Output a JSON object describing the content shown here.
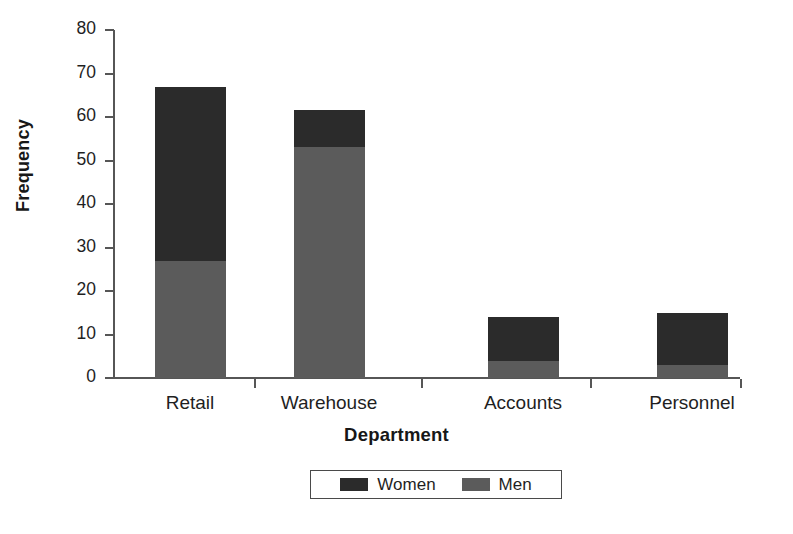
{
  "chart_data": {
    "type": "bar",
    "subtype": "stacked-bar",
    "title": "",
    "xlabel": "Department",
    "ylabel": "Frequency",
    "categories": [
      "Retail",
      "Warehouse",
      "Accounts",
      "Personnel"
    ],
    "series": [
      {
        "name": "Women",
        "values": [
          40,
          8.5,
          10,
          12
        ],
        "color": "#2b2b2b"
      },
      {
        "name": "Men",
        "values": [
          27,
          53,
          4,
          3
        ],
        "color": "#5b5b5b"
      }
    ],
    "stack_totals": [
      67,
      61.5,
      14,
      15
    ],
    "stack_order": [
      "Men",
      "Women"
    ],
    "ylim": [
      0,
      80
    ],
    "yticks": [
      0,
      10,
      20,
      30,
      40,
      50,
      60,
      70,
      80
    ],
    "ytick_labels": [
      "0",
      "10",
      "20",
      "30",
      "40",
      "50",
      "60",
      "70",
      "80"
    ],
    "grid": false,
    "legend_position": "bottom",
    "legend_entries": [
      "Women",
      "Men"
    ]
  },
  "axis": {
    "y_title": "Frequency",
    "x_title": "Department",
    "ticks": [
      {
        "label": "80",
        "value": 80
      },
      {
        "label": "70",
        "value": 70
      },
      {
        "label": "60",
        "value": 60
      },
      {
        "label": "50",
        "value": 50
      },
      {
        "label": "40",
        "value": 40
      },
      {
        "label": "30",
        "value": 30
      },
      {
        "label": "20",
        "value": 20
      },
      {
        "label": "10",
        "value": 10
      },
      {
        "label": "0",
        "value": 0
      }
    ]
  },
  "categories": [
    {
      "label": "Retail"
    },
    {
      "label": "Warehouse"
    },
    {
      "label": "Accounts"
    },
    {
      "label": "Personnel"
    }
  ],
  "legend": {
    "items": [
      {
        "label": "Women",
        "color": "#2b2b2b"
      },
      {
        "label": "Men",
        "color": "#5b5b5b"
      }
    ]
  },
  "colors": {
    "women": "#2b2b2b",
    "men": "#5b5b5b",
    "axis": "#565656",
    "text": "#1f1f1f",
    "background": "#ffffff"
  }
}
